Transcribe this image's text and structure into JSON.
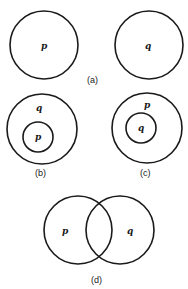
{
  "diagram": {
    "panels": [
      {
        "id": "a",
        "caption": "(a)",
        "circles": [
          {
            "label": "p",
            "cx": 44,
            "cy": 45,
            "r": 34
          },
          {
            "label": "q",
            "cx": 149,
            "cy": 45,
            "r": 34
          }
        ],
        "relation": "disjoint"
      },
      {
        "id": "b",
        "caption": "(b)",
        "circles": [
          {
            "label": "q",
            "cx": 42,
            "cy": 129,
            "r": 35
          },
          {
            "label": "p",
            "cx": 38,
            "cy": 137,
            "r": 15
          }
        ],
        "relation": "p subset of q"
      },
      {
        "id": "c",
        "caption": "(c)",
        "circles": [
          {
            "label": "p",
            "cx": 147,
            "cy": 128,
            "r": 35
          },
          {
            "label": "q",
            "cx": 141,
            "cy": 128,
            "r": 15
          }
        ],
        "relation": "q subset of p"
      },
      {
        "id": "d",
        "caption": "(d)",
        "circles": [
          {
            "label": "p",
            "cx": 78,
            "cy": 230,
            "r": 34
          },
          {
            "label": "q",
            "cx": 120,
            "cy": 230,
            "r": 34
          }
        ],
        "relation": "overlapping"
      }
    ],
    "labels": {
      "a_p": "p",
      "a_q": "q",
      "a_caption": "(a)",
      "b_outer": "q",
      "b_inner": "p",
      "b_caption": "(b)",
      "c_outer": "p",
      "c_inner": "q",
      "c_caption": "(c)",
      "d_left": "p",
      "d_right": "q",
      "d_caption": "(d)"
    },
    "colors": {
      "stroke": "#1a1a1a",
      "background": "#ffffff"
    }
  }
}
